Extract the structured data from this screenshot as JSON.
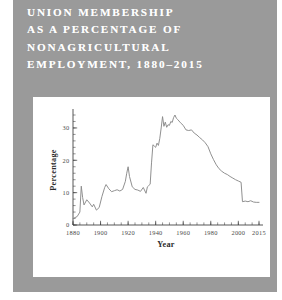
{
  "page": {
    "background_color": "#ffffff",
    "panel_color": "#9a9a9a",
    "card_color": "#ffffff"
  },
  "title": {
    "lines": [
      "UNION MEMBERSHIP",
      "AS A PERCENTAGE OF",
      "NONAGRICULTURAL",
      "EMPLOYMENT, 1880–2015"
    ],
    "color": "#ffffff"
  },
  "chart_data": {
    "type": "line",
    "xlabel": "Year",
    "ylabel": "Percentage",
    "xlim": [
      1880,
      2015
    ],
    "ylim": [
      0,
      34
    ],
    "grid": false,
    "legend": null,
    "line_color": "#8a8a8a",
    "xticks": [
      1880,
      1900,
      1920,
      1940,
      1960,
      1980,
      2000,
      2015
    ],
    "xtick_labels": [
      "1880",
      "1900",
      "1920",
      "1940",
      "1960",
      "1980",
      "2000",
      "2015"
    ],
    "xticks_minor_step": 5,
    "yticks": [
      0,
      10,
      20,
      30
    ],
    "ytick_labels": [
      "0",
      "10",
      "20",
      "30"
    ],
    "yticks_minor_step": 2,
    "series": [
      {
        "name": "Union membership (% of nonagricultural employment)",
        "x": [
          1880,
          1883,
          1885,
          1886,
          1887,
          1888,
          1890,
          1892,
          1894,
          1895,
          1897,
          1899,
          1901,
          1903,
          1904,
          1906,
          1908,
          1910,
          1912,
          1914,
          1916,
          1918,
          1919,
          1920,
          1921,
          1923,
          1925,
          1927,
          1929,
          1931,
          1933,
          1934,
          1935,
          1936,
          1937,
          1938,
          1939,
          1940,
          1941,
          1942,
          1943,
          1944,
          1945,
          1946,
          1947,
          1948,
          1949,
          1950,
          1951,
          1952,
          1953,
          1954,
          1955,
          1956,
          1958,
          1960,
          1962,
          1964,
          1966,
          1968,
          1970,
          1972,
          1974,
          1976,
          1978,
          1980,
          1982,
          1984,
          1986,
          1988,
          1990,
          1992,
          1994,
          1996,
          1998,
          2000,
          2002,
          2003,
          2005,
          2007,
          2009,
          2011,
          2013,
          2015
        ],
        "y": [
          2.0,
          2.6,
          4.0,
          12.0,
          8.5,
          6.2,
          7.8,
          6.8,
          5.6,
          6.4,
          4.6,
          5.4,
          8.8,
          11.6,
          12.5,
          11.2,
          10.3,
          10.6,
          10.9,
          10.5,
          11.0,
          13.5,
          16.0,
          18.0,
          15.0,
          11.8,
          11.0,
          10.8,
          10.4,
          11.6,
          9.8,
          11.8,
          12.2,
          12.6,
          19.2,
          24.8,
          24.4,
          24.0,
          25.3,
          24.6,
          26.8,
          30.0,
          33.5,
          30.5,
          31.8,
          30.2,
          31.0,
          30.8,
          32.0,
          31.7,
          33.2,
          34.0,
          33.0,
          32.6,
          31.6,
          30.8,
          29.4,
          29.2,
          29.4,
          28.4,
          27.8,
          27.0,
          26.3,
          25.4,
          24.2,
          22.0,
          20.2,
          18.6,
          17.4,
          16.6,
          16.0,
          15.6,
          15.0,
          14.5,
          14.0,
          13.6,
          13.2,
          7.2,
          7.4,
          7.2,
          7.5,
          7.1,
          7.0,
          7.0
        ]
      }
    ]
  }
}
